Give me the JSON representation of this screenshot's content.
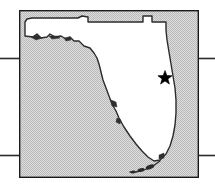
{
  "figure": {
    "kind": "locator-map",
    "width": 215,
    "height": 184,
    "background_color": "#ffffff"
  },
  "map_frame": {
    "label": "map-frame",
    "x": 19,
    "y": 10,
    "width": 180,
    "height": 168,
    "fill_color": "#d2d2d2",
    "stroke_color": "#1a1a1a",
    "stroke_width": 1.4
  },
  "state_outline": {
    "label": "Florida",
    "fill_color": "#ffffff",
    "stroke_color": "#2b2b2b",
    "stroke_width": 1.4,
    "path": "M 25 22 L 25 36 L 33 37 L 37 34 L 41 38 L 47 37 L 50 34 L 55 37 L 61 36 L 66 39 L 70 37 L 74 41 L 79 41 L 84 46 L 90 48 L 94 53 L 97 58 L 99 64 L 101 72 L 103 80 L 106 88 L 109 96 L 112 104 L 116 111 L 119 118 L 124 127 L 130 136 L 136 144 L 142 151 L 148 157 L 154 161 L 160 160 L 166 154 L 170 146 L 173 136 L 175 125 L 176 113 L 176 100 L 175 88 L 173 76 L 171 64 L 169 52 L 167 40 L 166 30 L 166 22 L 152 22 L 152 16 L 143 16 L 143 22 L 88 22 L 88 17 L 82 16 L 78 18 L 72 18 L 64 18 L 56 18 L 48 18 L 40 18 L 32 18 L 27 19 Z"
  },
  "coastal_details": [
    {
      "name": "panhandle-barrier-island-west",
      "path": "M 31 37 L 37 35 L 42 38 L 36 40 Z"
    },
    {
      "name": "panhandle-barrier-island-east",
      "path": "M 49 36 L 57 36 L 60 38 L 52 39 Z"
    },
    {
      "name": "apalachee-inlet",
      "path": "M 64 38 L 70 37 L 71 40 L 66 41 Z"
    },
    {
      "name": "tampa-bay-inlet",
      "path": "M 111 100 L 116 102 L 117 107 L 112 106 Z"
    },
    {
      "name": "charlotte-harbor-inlet",
      "path": "M 117 118 L 121 120 L 120 124 L 116 122 Z"
    },
    {
      "name": "biscayne-bay-inlet",
      "path": "M 159 155 L 164 153 L 164 158 L 159 159 Z"
    }
  ],
  "keys_chain": {
    "name": "florida-keys",
    "stroke_color": "#2b2b2b",
    "path": "M 160 161 L 153 166 L 144 170 L 136 172 L 130 172",
    "islands": [
      {
        "cx": 150,
        "cy": 167,
        "rx": 4.5,
        "ry": 2.2,
        "angle": -22
      },
      {
        "cx": 141,
        "cy": 170,
        "rx": 3.6,
        "ry": 1.8,
        "angle": -14
      },
      {
        "cx": 133,
        "cy": 172,
        "rx": 2.6,
        "ry": 1.5,
        "angle": -8
      }
    ]
  },
  "marker": {
    "name": "location-star",
    "shape": "star",
    "points": 5,
    "center_x": 165,
    "center_y": 78,
    "outer_radius": 7.5,
    "inner_radius": 3.1,
    "fill_color": "#000000"
  },
  "rule_lines": [
    {
      "name": "rule-upper-left",
      "x1": 0,
      "y1": 58.5,
      "x2": 19,
      "y2": 58.5
    },
    {
      "name": "rule-upper-right",
      "x1": 199,
      "y1": 58.5,
      "x2": 215,
      "y2": 58.5
    },
    {
      "name": "rule-lower-left",
      "x1": 0,
      "y1": 155.5,
      "x2": 19,
      "y2": 155.5
    },
    {
      "name": "rule-lower-right",
      "x1": 199,
      "y1": 155.5,
      "x2": 215,
      "y2": 155.5
    }
  ],
  "rule_style": {
    "color": "#2b2b2b",
    "width": 1.6
  }
}
